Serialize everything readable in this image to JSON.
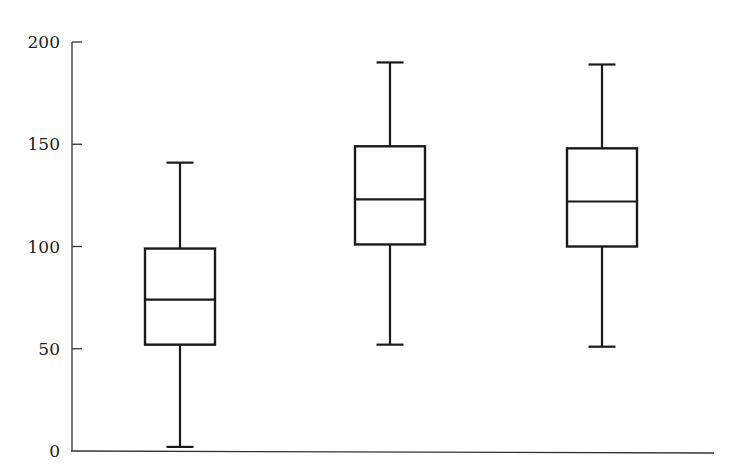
{
  "chart_data": {
    "type": "boxplot",
    "title": "",
    "xlabel": "",
    "ylabel": "",
    "ylim": [
      0,
      200
    ],
    "yticks": [
      0,
      50,
      100,
      150,
      200
    ],
    "ytick_labels": [
      "0",
      "50",
      "100",
      "150",
      "200"
    ],
    "grid": false,
    "legend": null,
    "categories": [
      "",
      "",
      ""
    ],
    "series": [
      {
        "name": "Box 1",
        "min": 2,
        "q1": 52,
        "median": 74,
        "q3": 99,
        "max": 141
      },
      {
        "name": "Box 2",
        "min": 52,
        "q1": 101,
        "median": 123,
        "q3": 149,
        "max": 190
      },
      {
        "name": "Box 3",
        "min": 51,
        "q1": 100,
        "median": 122,
        "q3": 148,
        "max": 189
      }
    ]
  },
  "style": {
    "line_color": "#1a1a1a",
    "axis_color": "#333333",
    "background": "#ffffff"
  },
  "layout": {
    "plot_left": 72,
    "plot_right": 714,
    "y_zero_px": 451,
    "y_max_px": 42,
    "box_centers": [
      180,
      390,
      602
    ],
    "box_width": 70,
    "cap_width": 27
  }
}
